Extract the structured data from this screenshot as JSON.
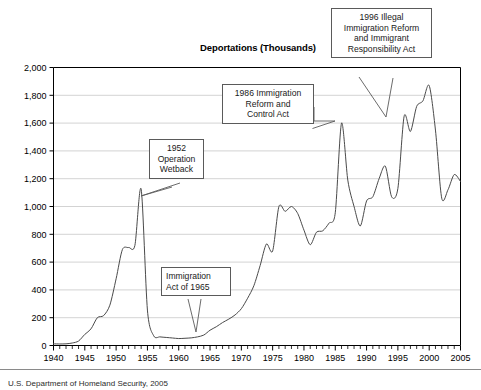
{
  "figure": {
    "title": "Deportations (Thousands)",
    "source_note": "U.S. Department of Homeland Security, 2005"
  },
  "callouts": [
    {
      "id": "callout-1996",
      "name": "callout-1996-act",
      "align": "center",
      "lines": [
        "1996 Illegal",
        "Immigration Reform",
        "and Immigrant",
        "Responsibility Act"
      ],
      "points_to_year": 1996
    },
    {
      "id": "callout-1986",
      "name": "callout-1986-act",
      "align": "center",
      "lines": [
        "1986 Immigration",
        "Reform and",
        "Control Act"
      ],
      "points_to_year": 1986
    },
    {
      "id": "callout-1952",
      "name": "callout-1952-operation-wetback",
      "align": "center",
      "lines": [
        "1952",
        "Operation",
        "Wetback"
      ],
      "points_to_year": 1954
    },
    {
      "id": "callout-1965",
      "name": "callout-1965-act",
      "align": "left",
      "lines": [
        "Immigration",
        "Act of 1965"
      ],
      "points_to_year": 1965
    }
  ],
  "chart_data": {
    "type": "line",
    "title": "Deportations (Thousands)",
    "xlabel": "",
    "ylabel": "",
    "xlim": [
      1940,
      2005
    ],
    "ylim": [
      0,
      2000
    ],
    "ytick_labels": [
      "0",
      "200",
      "400",
      "600",
      "800",
      "1,000",
      "1,200",
      "1,400",
      "1,600",
      "1,800",
      "2,000"
    ],
    "ytick_values": [
      0,
      200,
      400,
      600,
      800,
      1000,
      1200,
      1400,
      1600,
      1800,
      2000
    ],
    "xtick_labels": [
      "1940",
      "1945",
      "1950",
      "1955",
      "1960",
      "1965",
      "1970",
      "1975",
      "1980",
      "1985",
      "1990",
      "1995",
      "2000",
      "2005"
    ],
    "xtick_values": [
      1940,
      1945,
      1950,
      1955,
      1960,
      1965,
      1970,
      1975,
      1980,
      1985,
      1990,
      1995,
      2000,
      2005
    ],
    "x_minor_tick_step": 1,
    "grid": "horizontal",
    "legend": "none",
    "line_color": "#4a4a4a",
    "grid_color": "#c8c8c8",
    "axis_color": "#000000",
    "series": [
      {
        "name": "Deportations",
        "x": [
          1940,
          1941,
          1942,
          1943,
          1944,
          1945,
          1946,
          1947,
          1948,
          1949,
          1950,
          1951,
          1952,
          1953,
          1954,
          1955,
          1956,
          1957,
          1958,
          1959,
          1960,
          1961,
          1962,
          1963,
          1964,
          1965,
          1966,
          1967,
          1968,
          1969,
          1970,
          1971,
          1972,
          1973,
          1974,
          1975,
          1976,
          1977,
          1978,
          1979,
          1980,
          1981,
          1982,
          1983,
          1984,
          1985,
          1986,
          1987,
          1988,
          1989,
          1990,
          1991,
          1992,
          1993,
          1994,
          1995,
          1996,
          1997,
          1998,
          1999,
          2000,
          2001,
          2002,
          2003,
          2004,
          2005
        ],
        "y": [
          12,
          11,
          12,
          18,
          32,
          80,
          120,
          200,
          215,
          290,
          480,
          690,
          705,
          720,
          1125,
          255,
          70,
          62,
          58,
          54,
          50,
          52,
          55,
          62,
          75,
          110,
          135,
          165,
          190,
          220,
          265,
          340,
          430,
          575,
          730,
          680,
          1000,
          965,
          1000,
          950,
          830,
          725,
          815,
          825,
          880,
          955,
          1600,
          1190,
          1000,
          860,
          1040,
          1070,
          1200,
          1290,
          1070,
          1130,
          1650,
          1540,
          1720,
          1760,
          1870,
          1550,
          1060,
          1120,
          1230,
          1180
        ]
      }
    ],
    "annotations": [
      {
        "year": 1954,
        "label": "1952 Operation Wetback"
      },
      {
        "year": 1965,
        "label": "Immigration Act of 1965"
      },
      {
        "year": 1986,
        "label": "1986 Immigration Reform and Control Act"
      },
      {
        "year": 1996,
        "label": "1996 Illegal Immigration Reform and Immigrant Responsibility Act"
      }
    ]
  }
}
